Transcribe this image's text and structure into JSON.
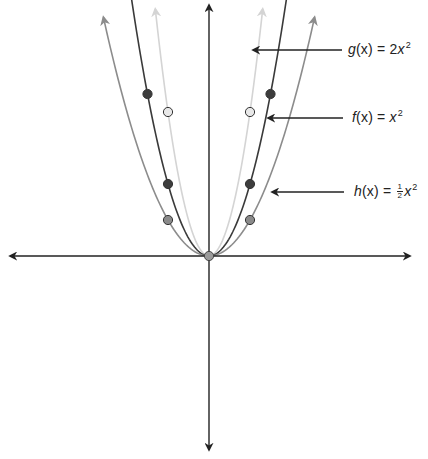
{
  "diagram": {
    "title": "",
    "axes": {
      "origin_px": [
        209,
        256
      ],
      "x_axis": {
        "from_px": 10,
        "to_px": 410,
        "arrows": "both"
      },
      "y_axis": {
        "from_px": 5,
        "to_px": 450,
        "arrows": "both"
      },
      "unit_px": {
        "x": 20.5,
        "y": 18
      },
      "color": "#222222"
    },
    "curves": [
      {
        "id": "g",
        "name": "g(x)",
        "coef": 2,
        "label_text": {
          "fn": "g",
          "arg": "(x)",
          "eq": " = 2",
          "var": "x",
          "exp": "2"
        },
        "color": "#d4d4d4",
        "x_extent": 2.62,
        "points": [
          {
            "x": -2,
            "y": 8
          },
          {
            "x": 2,
            "y": 8
          }
        ],
        "point_fill": "#e8e8e8",
        "label_arrow_px": {
          "x1": 342,
          "x2": 253,
          "y": 50
        },
        "label_pos_px": {
          "left": 348,
          "top": 40
        }
      },
      {
        "id": "f",
        "name": "f(x)",
        "coef": 1,
        "label_text": {
          "fn": "f",
          "arg": "(x)",
          "eq": " = ",
          "var": "x",
          "exp": "2"
        },
        "color": "#3a3a3a",
        "x_extent": 3.85,
        "points": [
          {
            "x": -2,
            "y": 4
          },
          {
            "x": 2,
            "y": 4
          },
          {
            "x": -3,
            "y": 9
          },
          {
            "x": 3,
            "y": 9
          }
        ],
        "point_fill": "#3d3d3d",
        "label_arrow_px": {
          "x1": 343,
          "x2": 268,
          "y": 118
        },
        "label_pos_px": {
          "left": 352,
          "top": 108
        }
      },
      {
        "id": "h",
        "name": "h(x)",
        "coef": 0.5,
        "label_text": {
          "fn": "h",
          "arg": "(x)",
          "eq": " = ",
          "frac_num": "1",
          "frac_den": "2",
          "var": "x",
          "exp": "2"
        },
        "color": "#8c8c8c",
        "x_extent": 5.15,
        "points": [
          {
            "x": -2,
            "y": 2
          },
          {
            "x": 2,
            "y": 2
          }
        ],
        "point_fill": "#8a8a8a",
        "label_arrow_px": {
          "x1": 344,
          "x2": 272,
          "y": 192
        },
        "label_pos_px": {
          "left": 354,
          "top": 182
        }
      }
    ],
    "origin_point": {
      "x": 0,
      "y": 0,
      "fill": "#9a9a9a"
    }
  }
}
